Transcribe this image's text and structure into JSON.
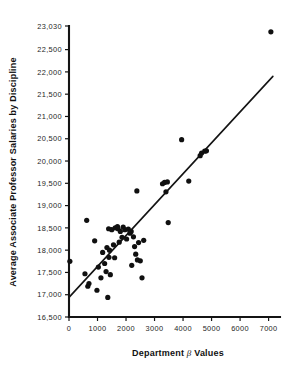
{
  "chart_data": {
    "type": "scatter",
    "title": "",
    "xlabel": "Department β Values",
    "ylabel": "Average Associate Professor Salaries by Discipline",
    "xlim": [
      0,
      7400
    ],
    "ylim": [
      16500,
      23030
    ],
    "grid": false,
    "legend": "none",
    "xticks": [
      0,
      1000,
      2000,
      3000,
      4000,
      5000,
      6000,
      7000
    ],
    "xtick_labels": [
      "0",
      "1000",
      "2000",
      "3000",
      "4000",
      "5000",
      "6000",
      "7000"
    ],
    "yticks": [
      16500,
      17000,
      17500,
      18000,
      18500,
      19000,
      19500,
      20000,
      20500,
      21000,
      21500,
      22000,
      22500,
      23030
    ],
    "ytick_labels": [
      "16,500",
      "17,000",
      "17,500",
      "18,000",
      "18,500",
      "19,000",
      "19,500",
      "20,000",
      "20,500",
      "21,000",
      "21,500",
      "22,000",
      "22,500",
      "23,030"
    ],
    "point_color": "#101010",
    "line_color": "#141414",
    "marker_radius": 2.6,
    "series": [
      {
        "name": "Departments",
        "points": [
          [
            30,
            17750
          ],
          [
            620,
            18670
          ],
          [
            560,
            17470
          ],
          [
            660,
            17190
          ],
          [
            700,
            17250
          ],
          [
            900,
            18210
          ],
          [
            980,
            17100
          ],
          [
            1030,
            17620
          ],
          [
            1120,
            17380
          ],
          [
            1180,
            17950
          ],
          [
            1250,
            17700
          ],
          [
            1300,
            17520
          ],
          [
            1330,
            18060
          ],
          [
            1360,
            16940
          ],
          [
            1390,
            18480
          ],
          [
            1400,
            17840
          ],
          [
            1420,
            18000
          ],
          [
            1450,
            17450
          ],
          [
            1500,
            18460
          ],
          [
            1560,
            18120
          ],
          [
            1600,
            17830
          ],
          [
            1620,
            18500
          ],
          [
            1700,
            18530
          ],
          [
            1720,
            18480
          ],
          [
            1760,
            18180
          ],
          [
            1800,
            18420
          ],
          [
            1860,
            18290
          ],
          [
            1900,
            18520
          ],
          [
            1960,
            18460
          ],
          [
            2020,
            18250
          ],
          [
            2080,
            18470
          ],
          [
            2140,
            18380
          ],
          [
            2180,
            18420
          ],
          [
            2200,
            17660
          ],
          [
            2260,
            18300
          ],
          [
            2300,
            18080
          ],
          [
            2340,
            17910
          ],
          [
            2380,
            19330
          ],
          [
            2400,
            17780
          ],
          [
            2440,
            18170
          ],
          [
            2500,
            17760
          ],
          [
            2560,
            17380
          ],
          [
            2620,
            18220
          ],
          [
            3280,
            19490
          ],
          [
            3350,
            19520
          ],
          [
            3400,
            19310
          ],
          [
            3450,
            19530
          ],
          [
            3480,
            18620
          ],
          [
            3950,
            20480
          ],
          [
            4200,
            19550
          ],
          [
            4600,
            20120
          ],
          [
            4650,
            20180
          ],
          [
            4760,
            20220
          ],
          [
            4820,
            20230
          ],
          [
            7080,
            22900
          ]
        ]
      }
    ],
    "trend_line": {
      "name": "fitted regression line",
      "start": [
        0,
        16940
      ],
      "end": [
        7150,
        21900
      ]
    }
  }
}
